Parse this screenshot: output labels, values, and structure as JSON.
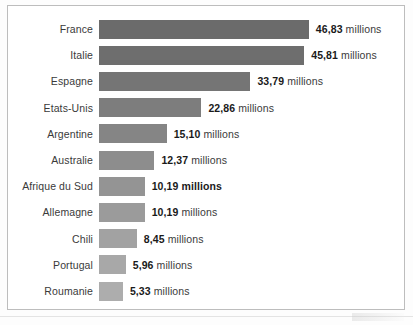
{
  "chart_data": {
    "type": "bar",
    "orientation": "horizontal",
    "title": "",
    "subtitle": "",
    "xlabel": "",
    "ylabel": "",
    "unit": "millions",
    "decimal_separator": ",",
    "grid": false,
    "legend": null,
    "xlim": [
      0,
      46.83
    ],
    "categories": [
      "France",
      "Italie",
      "Espagne",
      "Etats-Unis",
      "Argentine",
      "Australie",
      "Afrique du Sud",
      "Allemagne",
      "Chili",
      "Portugal",
      "Roumanie"
    ],
    "values": [
      46.83,
      45.81,
      33.79,
      22.86,
      15.1,
      12.37,
      10.19,
      10.19,
      8.45,
      5.96,
      5.33
    ],
    "value_labels": [
      "46,83",
      "45,81",
      "33,79",
      "22,86",
      "15,10",
      "12,37",
      "10,19",
      "10,19",
      "8,45",
      "5,96",
      "5,33"
    ],
    "bar_colors": [
      "#6b6b6b",
      "#6e6e6e",
      "#757575",
      "#7d7d7d",
      "#858585",
      "#8d8d8d",
      "#949494",
      "#9b9b9b",
      "#a2a2a2",
      "#a8a8a8",
      "#adadad"
    ],
    "emphasized_rows": [
      "Afrique du Sud"
    ],
    "rows": [
      {
        "label": "France",
        "value": 46.83,
        "value_label": "46,83",
        "unit": "millions",
        "color": "#6b6b6b",
        "bold_all": false
      },
      {
        "label": "Italie",
        "value": 45.81,
        "value_label": "45,81",
        "unit": "millions",
        "color": "#6e6e6e",
        "bold_all": false
      },
      {
        "label": "Espagne",
        "value": 33.79,
        "value_label": "33,79",
        "unit": "millions",
        "color": "#757575",
        "bold_all": false
      },
      {
        "label": "Etats-Unis",
        "value": 22.86,
        "value_label": "22,86",
        "unit": "millions",
        "color": "#7d7d7d",
        "bold_all": false
      },
      {
        "label": "Argentine",
        "value": 15.1,
        "value_label": "15,10",
        "unit": "millions",
        "color": "#858585",
        "bold_all": false
      },
      {
        "label": "Australie",
        "value": 12.37,
        "value_label": "12,37",
        "unit": "millions",
        "color": "#8d8d8d",
        "bold_all": false
      },
      {
        "label": "Afrique du Sud",
        "value": 10.19,
        "value_label": "10,19",
        "unit": "millions",
        "color": "#949494",
        "bold_all": true
      },
      {
        "label": "Allemagne",
        "value": 10.19,
        "value_label": "10,19",
        "unit": "millions",
        "color": "#9b9b9b",
        "bold_all": false
      },
      {
        "label": "Chili",
        "value": 8.45,
        "value_label": "8,45",
        "unit": "millions",
        "color": "#a2a2a2",
        "bold_all": false
      },
      {
        "label": "Portugal",
        "value": 5.96,
        "value_label": "5,96",
        "unit": "millions",
        "color": "#a8a8a8",
        "bold_all": false
      },
      {
        "label": "Roumanie",
        "value": 5.33,
        "value_label": "5,33",
        "unit": "millions",
        "color": "#adadad",
        "bold_all": false
      }
    ]
  },
  "layout": {
    "row_start_y": 13,
    "row_step": 26.2,
    "bar_origin_x": 91,
    "px_per_million": 4.48,
    "value_gap": 7
  }
}
